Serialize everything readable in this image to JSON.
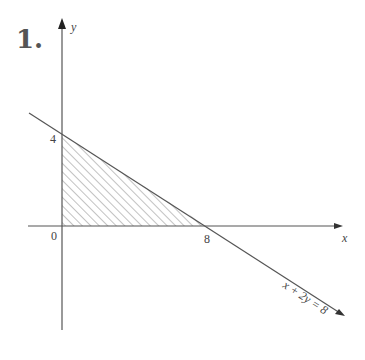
{
  "problem": {
    "number": "1."
  },
  "axes": {
    "x_label": "x",
    "y_label": "y",
    "origin_label": "0",
    "x_intercept_label": "8",
    "y_intercept_label": "4"
  },
  "line": {
    "equation": "x + 2y = 8"
  },
  "region": {
    "description": "shaded triangle between axes and line x + 2y = 8",
    "vertices": [
      [
        0,
        0
      ],
      [
        8,
        0
      ],
      [
        0,
        4
      ]
    ]
  },
  "colors": {
    "axis": "#555555",
    "line": "#555555",
    "hatch": "#777777",
    "text": "#444444"
  }
}
